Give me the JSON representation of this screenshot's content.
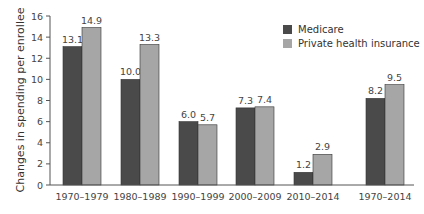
{
  "chart_data": {
    "type": "bar",
    "title": "",
    "xlabel": "",
    "ylabel": "Changes in spending per enrollee",
    "ylim": [
      0,
      16
    ],
    "yticks": [
      0,
      2,
      4,
      6,
      8,
      10,
      12,
      14,
      16
    ],
    "grid": false,
    "legend_position": "upper right",
    "categories": [
      "1970–1979",
      "1980–1989",
      "1990–1999",
      "2000–2009",
      "2010–2014",
      "1970–2014"
    ],
    "series": [
      {
        "name": "Medicare",
        "color": "#4a4a4a",
        "values": [
          13.1,
          10.0,
          6.0,
          7.3,
          1.2,
          8.2
        ],
        "labels": [
          "13.1",
          "10.0",
          "6.0",
          "7.3",
          "1.2",
          "8.2"
        ]
      },
      {
        "name": "Private health insurance",
        "color": "#a6a6a6",
        "values": [
          14.9,
          13.3,
          5.7,
          7.4,
          2.9,
          9.5
        ],
        "labels": [
          "14.9",
          "13.3",
          "5.7",
          "7.4",
          "2.9",
          "9.5"
        ]
      }
    ]
  }
}
